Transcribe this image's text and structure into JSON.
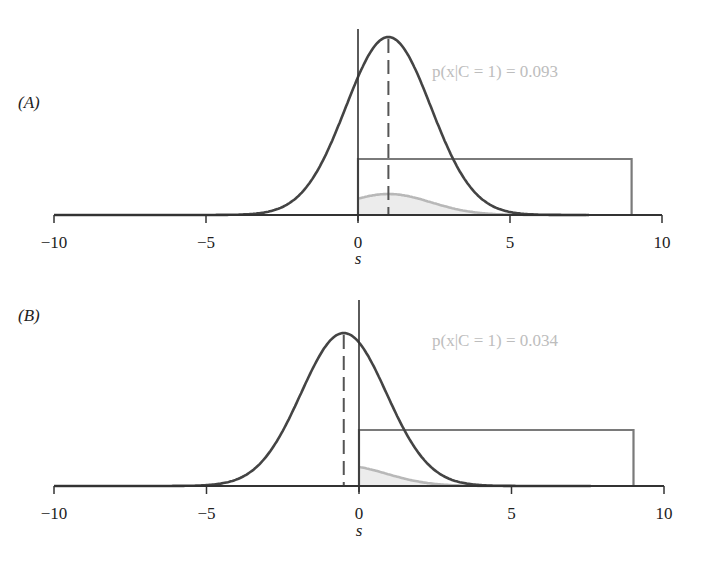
{
  "chart_data": [
    {
      "panel": "A",
      "panel_label": "(A)",
      "type": "line",
      "xlabel": "s",
      "ylabel": "",
      "xlim": [
        -10,
        10
      ],
      "xticks": [
        -10,
        -5,
        0,
        5,
        10
      ],
      "xtick_labels": [
        "−10",
        "−5",
        "0",
        "5",
        "10"
      ],
      "annotation": "p(x|C = 1) = 0.093",
      "series": [
        {
          "name": "gaussian-likelihood",
          "kind": "gaussian",
          "mean": 1.0,
          "sd": 1.4,
          "peak_px": 178,
          "color": "#444444"
        },
        {
          "name": "uniform-prior-box",
          "kind": "rect",
          "x_range": [
            0,
            9
          ],
          "height_px": 56,
          "color": "#7a7a7a"
        },
        {
          "name": "product-shaded",
          "kind": "shaded-product",
          "x_range": [
            0,
            7.5
          ],
          "peak_px": 21,
          "color": "#b8b8b8",
          "fill": "#ececec"
        },
        {
          "name": "mean-marker",
          "kind": "dashed-vline",
          "x": 1.0,
          "color": "#555555"
        }
      ]
    },
    {
      "panel": "B",
      "panel_label": "(B)",
      "type": "line",
      "xlabel": "s",
      "ylabel": "",
      "xlim": [
        -10,
        10
      ],
      "xticks": [
        -10,
        -5,
        0,
        5,
        10
      ],
      "xtick_labels": [
        "−10",
        "−5",
        "0",
        "5",
        "10"
      ],
      "annotation": "p(x|C = 1) = 0.034",
      "series": [
        {
          "name": "gaussian-likelihood",
          "kind": "gaussian",
          "mean": -0.5,
          "sd": 1.4,
          "peak_px": 153,
          "color": "#444444"
        },
        {
          "name": "uniform-prior-box",
          "kind": "rect",
          "x_range": [
            0,
            9
          ],
          "height_px": 56,
          "color": "#7a7a7a"
        },
        {
          "name": "product-shaded",
          "kind": "shaded-product",
          "x_range": [
            0,
            5
          ],
          "peak_px": 19,
          "color": "#b8b8b8",
          "fill": "#ececec"
        },
        {
          "name": "mean-marker",
          "kind": "dashed-vline",
          "x": -0.5,
          "color": "#555555"
        }
      ]
    }
  ]
}
